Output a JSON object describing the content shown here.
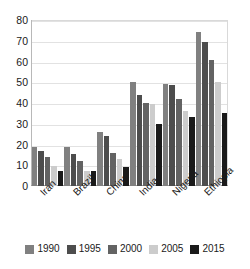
{
  "chart_data": {
    "type": "bar",
    "title": "",
    "subtitle": "",
    "xlabel": "",
    "ylabel": "",
    "ylim": [
      0,
      80
    ],
    "yticks": [
      0,
      10,
      20,
      30,
      40,
      50,
      60,
      70,
      80
    ],
    "grid": true,
    "legend_position": "bottom",
    "categories": [
      "Iran",
      "Brazil",
      "China",
      "India",
      "Nigeria",
      "Ethiopia"
    ],
    "series": [
      {
        "name": "1990",
        "color": "#808080",
        "values": [
          19,
          19,
          26,
          50,
          49,
          74
        ]
      },
      {
        "name": "1995",
        "color": "#4d4d4d",
        "values": [
          17,
          15.5,
          24,
          44,
          48.5,
          69.5
        ]
      },
      {
        "name": "2000",
        "color": "#636363",
        "values": [
          14,
          12,
          16,
          40,
          42,
          60.5
        ]
      },
      {
        "name": "2005",
        "color": "#cccccc",
        "values": [
          9.5,
          7,
          13,
          39.5,
          36,
          50
        ]
      },
      {
        "name": "2015",
        "color": "#1a1a1a",
        "values": [
          7,
          7,
          9,
          30,
          33.5,
          35
        ]
      }
    ]
  },
  "legend": {
    "items": [
      {
        "label": "1990"
      },
      {
        "label": "1995"
      },
      {
        "label": "2000"
      },
      {
        "label": "2005"
      },
      {
        "label": "2015"
      }
    ]
  }
}
